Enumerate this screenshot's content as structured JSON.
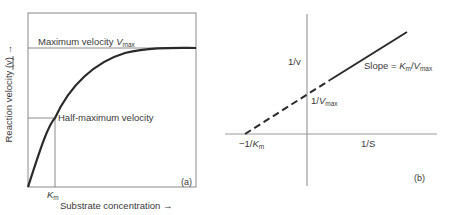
{
  "panel_a": {
    "tag": "(a)",
    "vmax_label_prefix": "Maximum velocity ",
    "vmax_symbol": "V",
    "vmax_sub": "max",
    "half_max_label": "Half-maximum velocity",
    "km_symbol": "K",
    "km_sub": "m",
    "x_axis_label": "Substrate concentration →",
    "y_axis_label": "Reaction velocity (v) →"
  },
  "panel_b": {
    "tag": "(b)",
    "y_axis_label": "1/v",
    "x_axis_label": "1/S",
    "y_intercept_prefix": "1/",
    "y_intercept_symbol": "V",
    "y_intercept_sub": "max",
    "x_intercept_prefix": "−1/",
    "x_intercept_symbol": "K",
    "x_intercept_sub": "m",
    "slope_prefix": "Slope = ",
    "slope_k": "K",
    "slope_k_sub": "m",
    "slope_mid": "/",
    "slope_v": "V",
    "slope_v_sub": "max"
  },
  "colors": {
    "line": "#2a2a2a",
    "frame": "#8a8a8a",
    "axis": "#9a9a9a"
  }
}
